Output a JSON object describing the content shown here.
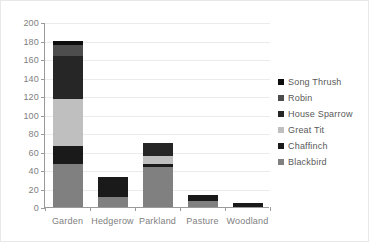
{
  "chart_data": {
    "type": "bar",
    "stacked": true,
    "title": "",
    "xlabel": "",
    "ylabel": "",
    "ylim": [
      0,
      200
    ],
    "ytick_step": 20,
    "yticks": [
      0,
      20,
      40,
      60,
      80,
      100,
      120,
      140,
      160,
      180,
      200
    ],
    "grid": true,
    "legend_position": "right",
    "categories": [
      "Garden",
      "Hedgerow",
      "Parkland",
      "Pasture",
      "Woodland"
    ],
    "series": [
      {
        "name": "Blackbird",
        "color": "#808080",
        "values": [
          47,
          11,
          43,
          7,
          0
        ]
      },
      {
        "name": "Chaffinch",
        "color": "#1a1a1a",
        "values": [
          19,
          21,
          3,
          6,
          4
        ]
      },
      {
        "name": "Great Tit",
        "color": "#bfbfbf",
        "values": [
          51,
          0,
          9,
          0,
          0
        ]
      },
      {
        "name": "House Sparrow",
        "color": "#262626",
        "values": [
          46,
          0,
          14,
          0,
          0
        ]
      },
      {
        "name": "Robin",
        "color": "#4d4d4d",
        "values": [
          12,
          0,
          0,
          0,
          0
        ]
      },
      {
        "name": "Song Thrush",
        "color": "#0d0d0d",
        "values": [
          5,
          0,
          0,
          0,
          0
        ]
      }
    ],
    "totals": [
      180,
      32,
      69,
      13,
      4
    ],
    "legend_order": [
      "Song Thrush",
      "Robin",
      "House Sparrow",
      "Great Tit",
      "Chaffinch",
      "Blackbird"
    ]
  },
  "colors": {
    "axis": "#9a9a9a",
    "gridline": "#eceaea",
    "tick_text": "#808080",
    "legend_text": "#595959",
    "frame_border": "#e8e8e8",
    "background": "#ffffff"
  }
}
